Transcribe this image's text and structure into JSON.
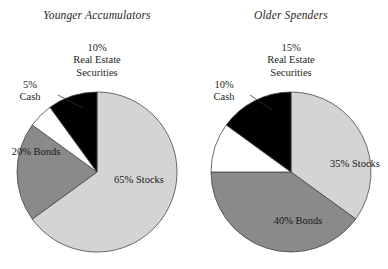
{
  "figure": {
    "background": "#ffffff",
    "width": 388,
    "height": 269
  },
  "palette": {
    "stocks": "#d4d4d4",
    "bonds": "#8a8a8a",
    "cash": "#ffffff",
    "real_estate_securities": "#000000",
    "outline": "#4a4442",
    "text": "#231f1c"
  },
  "panels": [
    {
      "id": "younger-accumulators",
      "title": "Younger Accumulators",
      "slices": [
        {
          "key": "stocks",
          "label": "Stocks",
          "pct_text": "65%",
          "value": 65,
          "color": "#d4d4d4",
          "label_placement": "inside"
        },
        {
          "key": "bonds",
          "label": "Bonds",
          "pct_text": "20%",
          "value": 20,
          "color": "#8a8a8a",
          "label_placement": "inside"
        },
        {
          "key": "cash",
          "label": "Cash",
          "pct_text": "5%",
          "value": 5,
          "color": "#ffffff",
          "label_placement": "outside"
        },
        {
          "key": "real_estate_securities",
          "label": "Real Estate Securities",
          "pct_text": "10%",
          "value": 10,
          "color": "#000000",
          "label_placement": "outside"
        }
      ],
      "callouts": {
        "real_estate": {
          "pct": "10%",
          "line1": "Real Estate",
          "line2": "Securities"
        },
        "cash": {
          "pct": "5%",
          "line1": "Cash"
        }
      },
      "inside_labels": {
        "stocks": {
          "pct": "65%",
          "name": "Stocks"
        },
        "bonds": {
          "pct": "20%",
          "name": "Bonds"
        }
      }
    },
    {
      "id": "older-spenders",
      "title": "Older Spenders",
      "slices": [
        {
          "key": "stocks",
          "label": "Stocks",
          "pct_text": "35%",
          "value": 35,
          "color": "#d4d4d4",
          "label_placement": "inside"
        },
        {
          "key": "bonds",
          "label": "Bonds",
          "pct_text": "40%",
          "value": 40,
          "color": "#8a8a8a",
          "label_placement": "inside"
        },
        {
          "key": "cash",
          "label": "Cash",
          "pct_text": "10%",
          "value": 10,
          "color": "#ffffff",
          "label_placement": "outside"
        },
        {
          "key": "real_estate_securities",
          "label": "Real Estate Securities",
          "pct_text": "15%",
          "value": 15,
          "color": "#000000",
          "label_placement": "outside"
        }
      ],
      "callouts": {
        "real_estate": {
          "pct": "15%",
          "line1": "Real Estate",
          "line2": "Securities"
        },
        "cash": {
          "pct": "10%",
          "line1": "Cash"
        }
      },
      "inside_labels": {
        "stocks": {
          "pct": "35%",
          "name": "Stocks"
        },
        "bonds": {
          "pct": "40%",
          "name": "Bonds"
        }
      }
    }
  ],
  "chart_data": [
    {
      "type": "pie",
      "title": "Younger Accumulators",
      "categories": [
        "Stocks",
        "Bonds",
        "Cash",
        "Real Estate Securities"
      ],
      "values": [
        65,
        20,
        5,
        10
      ],
      "unit": "%",
      "colors": [
        "#d4d4d4",
        "#8a8a8a",
        "#ffffff",
        "#000000"
      ],
      "start_angle_deg": 0,
      "direction": "clockwise",
      "legend": "none",
      "data_labels": [
        "65% Stocks",
        "20% Bonds",
        "5% Cash",
        "10% Real Estate Securities"
      ]
    },
    {
      "type": "pie",
      "title": "Older Spenders",
      "categories": [
        "Stocks",
        "Bonds",
        "Cash",
        "Real Estate Securities"
      ],
      "values": [
        35,
        40,
        10,
        15
      ],
      "unit": "%",
      "colors": [
        "#d4d4d4",
        "#8a8a8a",
        "#ffffff",
        "#000000"
      ],
      "start_angle_deg": 0,
      "direction": "clockwise",
      "legend": "none",
      "data_labels": [
        "35% Stocks",
        "40% Bonds",
        "10% Cash",
        "15% Real Estate Securities"
      ]
    }
  ]
}
